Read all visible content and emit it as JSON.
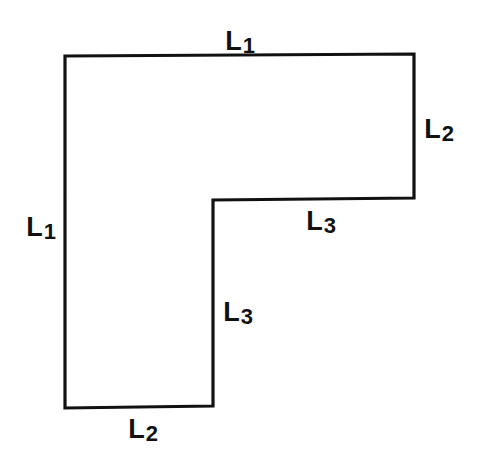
{
  "diagram": {
    "type": "L-shaped polygon",
    "outline_color": "#111111",
    "vertices": [
      [
        65,
        56
      ],
      [
        414,
        54
      ],
      [
        414,
        198
      ],
      [
        213,
        200
      ],
      [
        213,
        406
      ],
      [
        65,
        408
      ]
    ],
    "labels": [
      {
        "id": "top",
        "base": "L",
        "sub": "1",
        "x": 240,
        "y": 42
      },
      {
        "id": "right",
        "base": "L",
        "sub": "2",
        "x": 439,
        "y": 130
      },
      {
        "id": "inner-horizontal",
        "base": "L",
        "sub": "3",
        "x": 321,
        "y": 222
      },
      {
        "id": "left",
        "base": "L",
        "sub": "1",
        "x": 41,
        "y": 228
      },
      {
        "id": "inner-vertical",
        "base": "L",
        "sub": "3",
        "x": 238,
        "y": 313
      },
      {
        "id": "bottom",
        "base": "L",
        "sub": "2",
        "x": 143,
        "y": 430
      }
    ]
  }
}
